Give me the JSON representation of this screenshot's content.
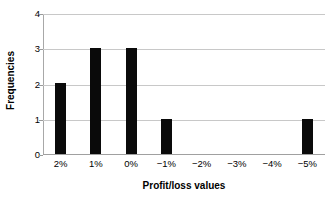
{
  "chart_data": {
    "type": "bar",
    "title": "",
    "subtitle": "",
    "xlabel": "Profit/loss values",
    "ylabel": "Frequencies",
    "categories": [
      "2%",
      "1%",
      "0%",
      "−1%",
      "−2%",
      "−3%",
      "−4%",
      "−5%"
    ],
    "values": [
      2,
      3,
      3,
      1,
      0,
      0,
      0,
      1
    ],
    "ylim": [
      0,
      4
    ],
    "yticks": [
      "4",
      "3",
      "2",
      "1",
      "0"
    ],
    "ytick_values": [
      4,
      3,
      2,
      1,
      0
    ],
    "grid": "horizontal",
    "legend": "none",
    "bar_color": "#0a0a0a",
    "gridline_color": "#c8c8c8",
    "axis_color": "#a0a0a0",
    "background": "#ffffff"
  }
}
